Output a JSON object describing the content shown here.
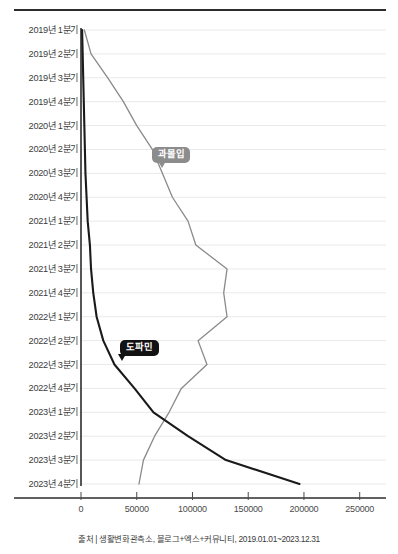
{
  "chart_data": {
    "type": "line",
    "orientation": "horizontal",
    "title": "",
    "xlabel": "",
    "ylabel": "",
    "xlim": [
      0,
      270000
    ],
    "ylim_categories_top_to_bottom": true,
    "grid": true,
    "legend": "inline-callouts",
    "xticks": [
      0,
      50000,
      100000,
      150000,
      200000,
      250000
    ],
    "xtick_labels": [
      "0",
      "50000",
      "100000",
      "150000",
      "200000",
      "250000"
    ],
    "categories": [
      "2019년 1분기",
      "2019년 2분기",
      "2019년 3분기",
      "2019년 4분기",
      "2020년 1분기",
      "2020년 2분기",
      "2020년 3분기",
      "2020년 4분기",
      "2021년 1분기",
      "2021년 2분기",
      "2021년 3분기",
      "2021년 4분기",
      "2022년 1분기",
      "2022년 2분기",
      "2022년 3분기",
      "2022년 4분기",
      "2023년 1분기",
      "2023년 2분기",
      "2023년 3분기",
      "2023년 4분기"
    ],
    "series": [
      {
        "name": "과몰입",
        "color": "#8a8a8a",
        "label_color": "#8c8c8c",
        "label_index": 6,
        "values": [
          3000,
          9000,
          24000,
          38000,
          50000,
          64000,
          73000,
          82000,
          96000,
          103000,
          131000,
          128000,
          131000,
          105000,
          113000,
          90000,
          79000,
          66000,
          56000,
          52000
        ]
      },
      {
        "name": "도파민",
        "color": "#1a1a1a",
        "label_color": "#121212",
        "label_index": 14,
        "values": [
          1000,
          1500,
          2000,
          2500,
          3000,
          3500,
          4000,
          5000,
          6000,
          8000,
          9000,
          11000,
          14000,
          20000,
          30000,
          48000,
          65000,
          96000,
          130000,
          196000
        ]
      }
    ],
    "annotations": [
      {
        "text": "과몰입",
        "style": "gray-callout"
      },
      {
        "text": "도파민",
        "style": "black-callout"
      }
    ]
  },
  "source": {
    "text": "출처 | 생활변화관측소, 블로그+엑스+커뮤니티, 2019.01.01~2023.12.31"
  },
  "colors": {
    "gray_series": "#8a8a8a",
    "black_series": "#1a1a1a",
    "grid": "#e9e9e9",
    "axis": "#2c2c2c",
    "text": "#3d3d3d"
  }
}
